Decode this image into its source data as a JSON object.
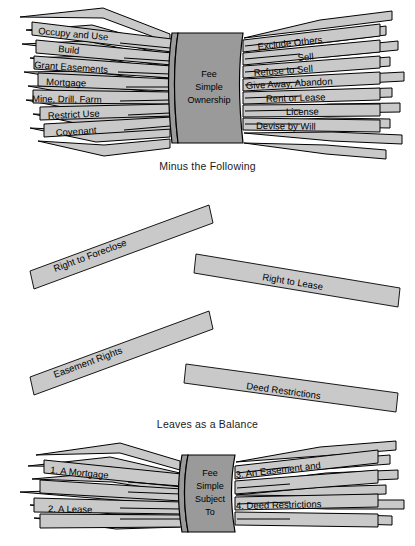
{
  "diagram": {
    "colors": {
      "bar_fill": "#c9c9c9",
      "hub_fill": "#9a9a9a",
      "stroke": "#000000",
      "background": "#ffffff",
      "text": "#000000"
    }
  },
  "top_bundle": {
    "hub_label": "Fee\nSimple\nOwnership",
    "hub_lines": [
      "Fee",
      "Simple",
      "Ownership"
    ],
    "left_sticks": [
      {
        "label": "Occupy and Use"
      },
      {
        "label": "Build"
      },
      {
        "label": "Grant Easements"
      },
      {
        "label": "Mortgage"
      },
      {
        "label": "Mine, Drill, Farm"
      },
      {
        "label": "Restrict Use"
      },
      {
        "label": "Covenant"
      }
    ],
    "right_sticks": [
      {
        "label": "Exclude Others"
      },
      {
        "label": "Sell"
      },
      {
        "label": "Refuse to Sell"
      },
      {
        "label": "Give Away, Abandon"
      },
      {
        "label": "Rent or Lease"
      },
      {
        "label": "License"
      },
      {
        "label": "Devise by Will"
      }
    ]
  },
  "captions": {
    "minus": "Minus the Following",
    "leaves": "Leaves as a Balance"
  },
  "middle_bars": [
    {
      "label": "Right to Foreclose"
    },
    {
      "label": "Right to Lease"
    },
    {
      "label": "Easement Rights"
    },
    {
      "label": "Deed Restrictions"
    }
  ],
  "bottom_bundle": {
    "hub_lines": [
      "Fee",
      "Simple",
      "Subject",
      "To"
    ],
    "left_sticks": [
      {
        "label": "1. A Mortgage"
      },
      {
        "label": "2. A Lease"
      }
    ],
    "right_sticks": [
      {
        "label": "3. An Easement and"
      },
      {
        "label": "4. Deed Restrictions"
      }
    ]
  }
}
